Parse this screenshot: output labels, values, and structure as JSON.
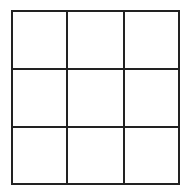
{
  "grid": {
    "rows": 3,
    "columns": 3,
    "line_color": "#222222",
    "background": "#ffffff",
    "cells": [
      [
        "",
        "",
        ""
      ],
      [
        "",
        "",
        ""
      ],
      [
        "",
        "",
        ""
      ]
    ]
  }
}
